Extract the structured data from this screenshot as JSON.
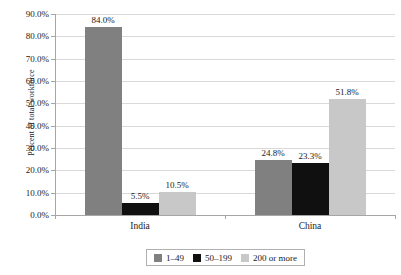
{
  "chart_data": {
    "type": "bar",
    "title": "",
    "subtitle": "",
    "xlabel": "",
    "ylabel": "Percent of total workforce",
    "categories": [
      "India",
      "China"
    ],
    "series": [
      {
        "name": "1–49",
        "color": "#808080",
        "values": [
          84.0,
          24.8
        ],
        "labels": [
          "84.0%",
          "24.8%"
        ]
      },
      {
        "name": "50–199",
        "color": "#101010",
        "values": [
          5.5,
          23.3
        ],
        "labels": [
          "5.5%",
          "23.3%"
        ]
      },
      {
        "name": "200 or more",
        "color": "#c8c8c8",
        "values": [
          10.5,
          51.8
        ],
        "labels": [
          "10.5%",
          "51.8%"
        ]
      }
    ],
    "ylim": [
      0,
      90
    ],
    "ytick_step": 10,
    "ytick_labels": [
      "0.0%",
      "10.0%",
      "20.0%",
      "30.0%",
      "40.0%",
      "50.0%",
      "60.0%",
      "70.0%",
      "80.0%",
      "90.0%"
    ],
    "grid": true,
    "grid_axis": "y",
    "legend_position": "bottom",
    "value_labels": true,
    "value_label_format": "0.0%"
  },
  "axis": {
    "y_title": "Percent of total workforce"
  },
  "legend": {
    "items": [
      {
        "label": "1–49"
      },
      {
        "label": "50–199"
      },
      {
        "label": "200 or more"
      }
    ]
  }
}
